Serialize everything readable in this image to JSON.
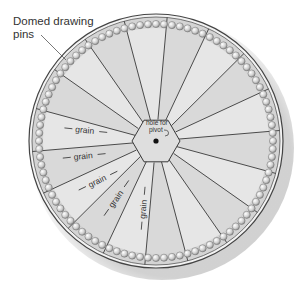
{
  "diagram": {
    "callout": {
      "label_line1": "Domed drawing",
      "label_line2": "pins"
    },
    "center_label": {
      "line1": "hole for",
      "line2": "pivot"
    },
    "grain_label": "grain",
    "grain_labels": [
      {
        "text": "grain",
        "x": 84,
        "y": 133,
        "angle": 6
      },
      {
        "text": "grain",
        "x": 83,
        "y": 159,
        "angle": -6
      },
      {
        "text": "grain",
        "x": 98,
        "y": 184,
        "angle": -26
      },
      {
        "text": "grain",
        "x": 118,
        "y": 201,
        "angle": -55
      },
      {
        "text": "grain",
        "x": 146,
        "y": 210,
        "angle": -85
      }
    ],
    "geometry": {
      "center_x": 156,
      "center_y": 141,
      "outer_radius": 127,
      "inner_rim_radius": 124,
      "pin_ring_radius": 117,
      "pin_radius": 3.6,
      "pin_count": 92,
      "segment_count": 18,
      "hex_radius": 24
    },
    "colors": {
      "board_fill": "#d4d4d4",
      "segment_light": "#e6e6e6",
      "segment_line": "#3a3a3a",
      "rim": "#555555",
      "pin_fill": "#e8e8e8",
      "pin_stroke": "#6e6e6e",
      "hex_fill": "#dcdcdc",
      "text": "#333333"
    }
  }
}
